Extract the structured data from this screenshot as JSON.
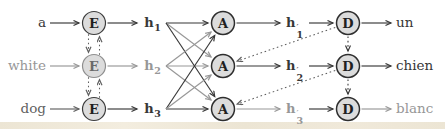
{
  "colors": {
    "dark": "#373737",
    "gray": "#979797",
    "mid": "#5f5f5f",
    "node_fill": "#dcdcdc",
    "background": "#ffffff",
    "bottom_strip": "#ece5d4"
  },
  "nodes": {
    "encoder": {
      "label": "E"
    },
    "attention": {
      "label": "A"
    },
    "decoder": {
      "label": "D"
    }
  },
  "inputs": [
    {
      "word": "a",
      "tone": "dark"
    },
    {
      "word": "white",
      "tone": "gray"
    },
    {
      "word": "dog",
      "tone": "mid"
    }
  ],
  "outputs": [
    {
      "word": "un",
      "tone": "dark"
    },
    {
      "word": "chien",
      "tone": "dark"
    },
    {
      "word": "blanc",
      "tone": "gray"
    }
  ],
  "encoder_states": [
    {
      "base": "h",
      "sub": "1",
      "tone": "dark"
    },
    {
      "base": "h",
      "sub": "2",
      "tone": "gray"
    },
    {
      "base": "h",
      "sub": "3",
      "tone": "dark"
    }
  ],
  "decoder_states": [
    {
      "base": "h",
      "prime": "′",
      "sub": "1",
      "tone": "dark"
    },
    {
      "base": "h",
      "prime": "′",
      "sub": "2",
      "tone": "dark"
    },
    {
      "base": "h",
      "prime": "′",
      "sub": "3",
      "tone": "gray"
    }
  ],
  "edges": [
    {
      "from": "in1",
      "to": "E1",
      "style": "solid",
      "tone": "dark"
    },
    {
      "from": "in2",
      "to": "E2",
      "style": "solid",
      "tone": "gray"
    },
    {
      "from": "in3",
      "to": "E3",
      "style": "solid",
      "tone": "mid"
    },
    {
      "from": "E1",
      "to": "h1",
      "style": "solid",
      "tone": "dark"
    },
    {
      "from": "E2",
      "to": "h2",
      "style": "solid",
      "tone": "gray"
    },
    {
      "from": "E3",
      "to": "h3",
      "style": "solid",
      "tone": "dark"
    },
    {
      "from": "h1",
      "to": "A1",
      "style": "solid",
      "tone": "dark"
    },
    {
      "from": "h2",
      "to": "A2",
      "style": "solid",
      "tone": "gray"
    },
    {
      "from": "h3",
      "to": "A3",
      "style": "solid",
      "tone": "dark"
    },
    {
      "from": "h1",
      "to": "A2",
      "style": "solid",
      "tone": "gray"
    },
    {
      "from": "h1",
      "to": "A3",
      "style": "solid",
      "tone": "dark"
    },
    {
      "from": "h2",
      "to": "A1",
      "style": "solid",
      "tone": "gray"
    },
    {
      "from": "h2",
      "to": "A3",
      "style": "solid",
      "tone": "gray"
    },
    {
      "from": "h3",
      "to": "A1",
      "style": "solid",
      "tone": "dark"
    },
    {
      "from": "h3",
      "to": "A2",
      "style": "solid",
      "tone": "gray"
    },
    {
      "from": "A1",
      "to": "hp1",
      "style": "solid",
      "tone": "dark"
    },
    {
      "from": "A2",
      "to": "hp2",
      "style": "solid",
      "tone": "dark"
    },
    {
      "from": "A3",
      "to": "hp3",
      "style": "solid",
      "tone": "gray"
    },
    {
      "from": "hp1",
      "to": "D1",
      "style": "solid",
      "tone": "dark"
    },
    {
      "from": "hp2",
      "to": "D2",
      "style": "solid",
      "tone": "dark"
    },
    {
      "from": "hp3",
      "to": "D3",
      "style": "solid",
      "tone": "dark"
    },
    {
      "from": "D1",
      "to": "out1",
      "style": "solid",
      "tone": "dark"
    },
    {
      "from": "D2",
      "to": "out2",
      "style": "solid",
      "tone": "dark"
    },
    {
      "from": "D3",
      "to": "out3",
      "style": "solid",
      "tone": "gray"
    },
    {
      "from": "E1",
      "to": "E2",
      "style": "dotted",
      "tone": "mid",
      "dx": -5.5
    },
    {
      "from": "E2",
      "to": "E1",
      "style": "dotted",
      "tone": "mid",
      "dx": 5.5
    },
    {
      "from": "E2",
      "to": "E3",
      "style": "dotted",
      "tone": "mid",
      "dx": -5.5
    },
    {
      "from": "E3",
      "to": "E2",
      "style": "dotted",
      "tone": "mid",
      "dx": 5.5
    },
    {
      "from": "D1",
      "to": "D2",
      "style": "dotted",
      "tone": "dark"
    },
    {
      "from": "D2",
      "to": "D3",
      "style": "dotted",
      "tone": "dark"
    },
    {
      "from": "D1",
      "to": "A2",
      "style": "dotted",
      "tone": "mid"
    },
    {
      "from": "D2",
      "to": "A3",
      "style": "dotted",
      "tone": "mid"
    }
  ]
}
